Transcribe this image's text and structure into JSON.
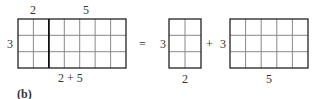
{
  "figure_label": "(b)",
  "left": {
    "top_labels": [
      "2",
      "5"
    ],
    "side_label": "3",
    "bottom_label": "2 + 5",
    "rows": 3,
    "cols_a": 2,
    "cols_b": 5
  },
  "equals": "=",
  "plus": "+",
  "right_a": {
    "side_label": "3",
    "bottom_label": "2",
    "rows": 3,
    "cols": 2
  },
  "right_b": {
    "side_label": "3",
    "bottom_label": "5",
    "rows": 3,
    "cols": 5
  },
  "colors": {
    "outline": "#222222",
    "gridline": "#888888"
  }
}
